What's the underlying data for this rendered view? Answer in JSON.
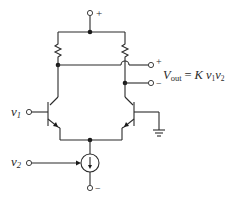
{
  "diagram": {
    "type": "circuit-schematic",
    "supply": {
      "top_terminal_label": "+",
      "bottom_terminal_label": "−"
    },
    "inputs": [
      {
        "name": "v",
        "sub": "1",
        "role": "input to left transistor base"
      },
      {
        "name": "v",
        "sub": "2",
        "role": "controls current source"
      }
    ],
    "output": {
      "plus_label": "+",
      "minus_label": "−",
      "equation": {
        "lhs": "V",
        "lhs_sub": "out",
        "equals": "=",
        "K": "K",
        "v1": "v",
        "v1_sub": "1",
        "v2": "v",
        "v2_sub": "2"
      }
    },
    "components": [
      "resistor-left",
      "resistor-right",
      "npn-transistor-left",
      "npn-transistor-right",
      "controlled-current-source",
      "ground"
    ],
    "colors": {
      "line": "#2a2a2a",
      "background": "#ffffff"
    }
  }
}
